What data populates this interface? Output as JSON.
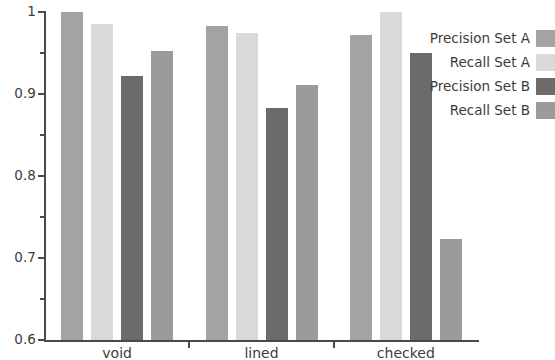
{
  "chart_data": {
    "type": "bar",
    "title": "",
    "xlabel": "",
    "ylabel": "",
    "categories": [
      "void",
      "lined",
      "checked"
    ],
    "series": [
      {
        "name": "Precision Set A",
        "color": "#a3a3a3",
        "values": [
          1.0,
          0.983,
          0.972
        ]
      },
      {
        "name": "Recall Set A",
        "color": "#d9d9d9",
        "values": [
          0.985,
          0.975,
          1.0
        ]
      },
      {
        "name": "Precision Set B",
        "color": "#6b6b6b",
        "values": [
          0.922,
          0.883,
          0.95
        ]
      },
      {
        "name": "Recall Set B",
        "color": "#9b9b9b",
        "values": [
          0.953,
          0.911,
          0.723
        ]
      }
    ],
    "ylim": [
      0.6,
      1.0
    ],
    "ytick_labels": [
      "1",
      "0.9",
      "0.8",
      "0.7",
      "0.6"
    ],
    "ytick_values": [
      1.0,
      0.9,
      0.8,
      0.7,
      0.6
    ],
    "yminor_values": [
      0.95,
      0.85,
      0.75,
      0.65
    ],
    "grid": false,
    "legend_position": "right"
  },
  "legend": {
    "entries": [
      {
        "label": "Precision Set A",
        "color": "#a3a3a3"
      },
      {
        "label": "Recall Set A",
        "color": "#d9d9d9"
      },
      {
        "label": "Precision Set B",
        "color": "#6b6b6b"
      },
      {
        "label": "Recall Set B",
        "color": "#9b9b9b"
      }
    ]
  },
  "axes": {
    "y_labels": [
      "1",
      "0.9",
      "0.8",
      "0.7",
      "0.6"
    ],
    "x_labels": [
      "void",
      "lined",
      "checked"
    ]
  }
}
